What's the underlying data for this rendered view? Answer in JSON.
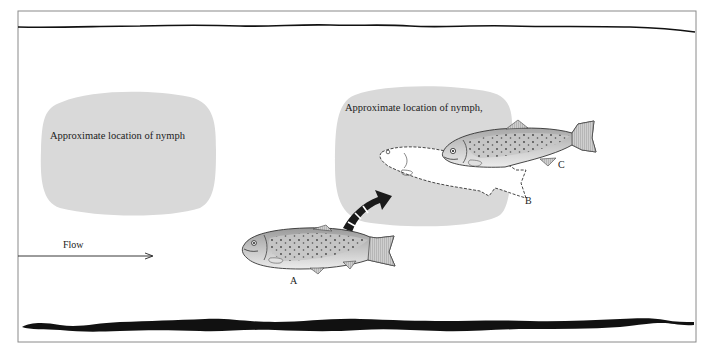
{
  "diagram": {
    "frame": {
      "x": 18,
      "y": 11,
      "width": 678,
      "height": 331,
      "stroke": "#8a8a8a"
    },
    "colors": {
      "background": "#ffffff",
      "nymph_zone": "#d9d9d9",
      "riverbank": "#111111",
      "fish_body": "#c9c9c9",
      "fish_outline": "#333333",
      "ghost_fish_fill": "#ffffff",
      "arrow": "#1a1a1a",
      "text": "#222222"
    },
    "nymph_zones": [
      {
        "id": "left",
        "label": "Approximate location of nymph"
      },
      {
        "id": "right",
        "label": "Approximate location of nymph,"
      }
    ],
    "flow": {
      "label": "Flow",
      "direction": "left-to-right"
    },
    "fish": [
      {
        "id": "A",
        "label": "A",
        "state": "starting position, solid"
      },
      {
        "id": "B",
        "label": "B",
        "state": "rising to intercept, dashed outline"
      },
      {
        "id": "C",
        "label": "C",
        "state": "positioned at nymph, solid"
      }
    ],
    "movement_arrow": {
      "style": "curved striped arrow",
      "from": "A",
      "to": "B"
    }
  }
}
